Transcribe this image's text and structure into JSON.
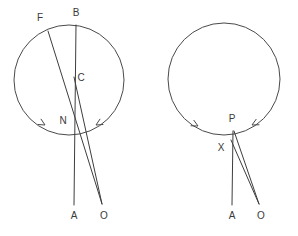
{
  "figure": {
    "background_color": "#ffffff",
    "stroke_color": "#3d3d3d",
    "label_color": "#3a3a3a",
    "width": 298,
    "height": 236
  },
  "diagrams": [
    {
      "id": "left-diagram",
      "name": "left-circle-diagram",
      "circle": {
        "cx": 69,
        "cy": 80,
        "r": 55
      },
      "points": [
        {
          "key": "F",
          "label": "F",
          "x": 40,
          "y": 18,
          "dot_x": 48,
          "dot_y": 31
        },
        {
          "key": "B",
          "label": "B",
          "x": 76,
          "y": 13,
          "dot_x": 76,
          "dot_y": 25
        },
        {
          "key": "C",
          "label": "C",
          "x": 81,
          "y": 78,
          "dot_x": 74,
          "dot_y": 78
        },
        {
          "key": "N",
          "label": "N",
          "x": 63,
          "y": 121,
          "dot_x": 72,
          "dot_y": 122
        },
        {
          "key": "A",
          "label": "A",
          "x": 74,
          "y": 216,
          "dot_x": 74,
          "dot_y": 205
        },
        {
          "key": "O",
          "label": "O",
          "x": 104,
          "y": 216,
          "dot_x": 102,
          "dot_y": 204
        }
      ],
      "segments": [
        {
          "name": "segment-B-A",
          "x1": 76,
          "y1": 25,
          "x2": 74,
          "y2": 205
        },
        {
          "name": "segment-F-O",
          "x1": 48,
          "y1": 31,
          "x2": 102,
          "y2": 204
        },
        {
          "name": "segment-C-O",
          "x1": 74,
          "y1": 77,
          "x2": 102,
          "y2": 204
        }
      ],
      "arc_arrows": [
        {
          "name": "arc-arrow-left",
          "x": 45,
          "y": 125,
          "angle": 150
        },
        {
          "name": "arc-arrow-right",
          "x": 96,
          "y": 125,
          "angle": 30
        }
      ]
    },
    {
      "id": "right-diagram",
      "name": "right-circle-diagram",
      "circle": {
        "cx": 224,
        "cy": 79,
        "r": 56
      },
      "points": [
        {
          "key": "P",
          "label": "P",
          "x": 232,
          "y": 119,
          "dot_x": 232,
          "dot_y": 131
        },
        {
          "key": "X",
          "label": "X",
          "x": 221,
          "y": 148,
          "dot_x": 230,
          "dot_y": 142
        },
        {
          "key": "A",
          "label": "A",
          "x": 232,
          "y": 216,
          "dot_x": 232,
          "dot_y": 205
        },
        {
          "key": "O",
          "label": "O",
          "x": 261,
          "y": 216,
          "dot_x": 259,
          "dot_y": 204
        }
      ],
      "segments": [
        {
          "name": "segment-P-A",
          "x1": 233,
          "y1": 131,
          "x2": 232,
          "y2": 205
        },
        {
          "name": "segment-P-O",
          "x1": 234,
          "y1": 131,
          "x2": 259,
          "y2": 204
        },
        {
          "name": "segment-X-O",
          "x1": 231,
          "y1": 140,
          "x2": 259,
          "y2": 204
        }
      ],
      "arc_arrows": [
        {
          "name": "arc-arrow-left",
          "x": 198,
          "y": 126,
          "angle": 152
        },
        {
          "name": "arc-arrow-right",
          "x": 252,
          "y": 125,
          "angle": 28
        }
      ]
    }
  ]
}
